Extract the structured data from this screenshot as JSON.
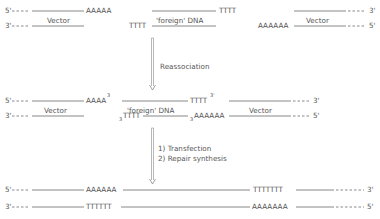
{
  "labels": {
    "five_prime": "5'",
    "three_prime": "3'",
    "sup3": "3'",
    "sup3_short": "3",
    "vector": "Vector",
    "foreign_dna": "'foreign' DNA",
    "a5": "AAAAA",
    "a4": "AAAA",
    "a6": "AAAAAA",
    "a7": "AAAAAAA",
    "t4": "TTTT",
    "t6": "TTTTTT",
    "t7": "TTTTTTT"
  },
  "steps": {
    "step1": "Reassociation",
    "step2_line1": "1) Transfection",
    "step2_line2": "2) Repair synthesis"
  }
}
